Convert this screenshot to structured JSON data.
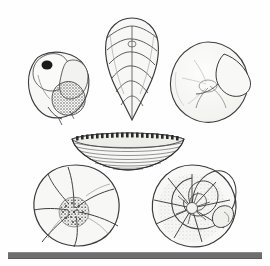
{
  "plate": {
    "title": "Foraminifera specimen plate",
    "background_color": "#fefefe",
    "ink_color": "#3a3a3a",
    "fill_color": "#f7f7f5",
    "stipple_color": "#555555",
    "width": 270,
    "height": 266
  },
  "scale_bar": {
    "name": "scale-bar",
    "color": "#6e6e6e",
    "x": 8,
    "y": 252,
    "width": 254,
    "height": 5
  },
  "specimens": [
    {
      "id": "specimen-top-left",
      "label": "Trochospiral test with stippled apertural face",
      "position": "top-left",
      "x": 18,
      "y": 45,
      "width": 88,
      "height": 82,
      "view": "apertural",
      "features": [
        "dark-oval-aperture",
        "dense-stipple-texture",
        "inflated-chambers"
      ],
      "coiling": "trochospiral"
    },
    {
      "id": "specimen-top-center",
      "label": "Biserial elongate test, tapering",
      "position": "top-center",
      "x": 96,
      "y": 12,
      "width": 72,
      "height": 112,
      "view": "side",
      "features": [
        "chevron-chambers",
        "pointed-base",
        "rounded-apex"
      ],
      "coiling": "biserial"
    },
    {
      "id": "specimen-top-right",
      "label": "Smooth planispiral disc with projecting final chamber",
      "position": "top-right",
      "x": 164,
      "y": 38,
      "width": 92,
      "height": 92,
      "view": "spiral",
      "features": [
        "smooth-surface",
        "projecting-final-chamber",
        "faint-sutures"
      ],
      "coiling": "planispiral"
    },
    {
      "id": "specimen-center",
      "label": "Lenticular test viewed edge-on with marginal pore row",
      "position": "center",
      "x": 68,
      "y": 127,
      "width": 120,
      "height": 46,
      "view": "edge",
      "features": [
        "marginal-pore-row",
        "horizontal-striations",
        "keeled-periphery"
      ],
      "coiling": "lenticular"
    },
    {
      "id": "specimen-bottom-left",
      "label": "Lobate trochospiral test with granular umbilicus",
      "position": "bottom-left",
      "x": 30,
      "y": 162,
      "width": 94,
      "height": 88,
      "view": "umbilical",
      "features": [
        "lobate-outline",
        "granular-umbilical-boss",
        "depressed-sutures"
      ],
      "coiling": "trochospiral"
    },
    {
      "id": "specimen-bottom-right",
      "label": "Planispiral involute test with radial septa",
      "position": "bottom-right",
      "x": 146,
      "y": 162,
      "width": 94,
      "height": 88,
      "view": "lateral",
      "features": [
        "logarithmic-spiral",
        "radial-septa",
        "raised-final-chamber"
      ],
      "coiling": "planispiral"
    }
  ]
}
